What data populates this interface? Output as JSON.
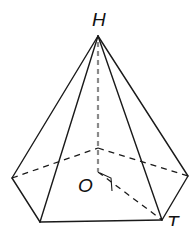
{
  "diagram": {
    "type": "pentagonal-pyramid",
    "labels": {
      "apex": "H",
      "center": "O",
      "vertex": "T"
    },
    "colors": {
      "edge": "#1a1a1a",
      "height_line": "#8a8a8a"
    },
    "points": {
      "H": [
        98,
        36
      ],
      "O": [
        98,
        172
      ],
      "base_left": [
        12,
        178
      ],
      "base_front_left": [
        40,
        222
      ],
      "base_front_right_T": [
        162,
        220
      ],
      "base_right": [
        188,
        176
      ],
      "base_back": [
        98,
        148
      ]
    },
    "features": [
      "height HO (dashed)",
      "hidden base edges dashed",
      "right angle at O on segment OT"
    ]
  }
}
